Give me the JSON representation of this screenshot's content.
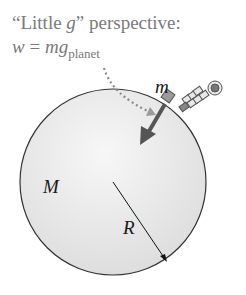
{
  "diagram": {
    "title_prefix": "“Little ",
    "title_var": "g",
    "title_suffix": "” perspective:",
    "equation": {
      "lhs": "w",
      "op": " = ",
      "m": "m",
      "g": "g",
      "subscript": "planet"
    },
    "labels": {
      "small_mass": "m",
      "planet_mass": "M",
      "radius": "R"
    },
    "planet": {
      "center": [
        113,
        182
      ],
      "radius": 93,
      "fill": "#e6e6e6",
      "stroke": "#333333"
    },
    "colors": {
      "text_gray": "#7a7a7a",
      "arrow": "#555555",
      "dotted": "#8a8a8a",
      "block": "#9a9a9a"
    }
  }
}
